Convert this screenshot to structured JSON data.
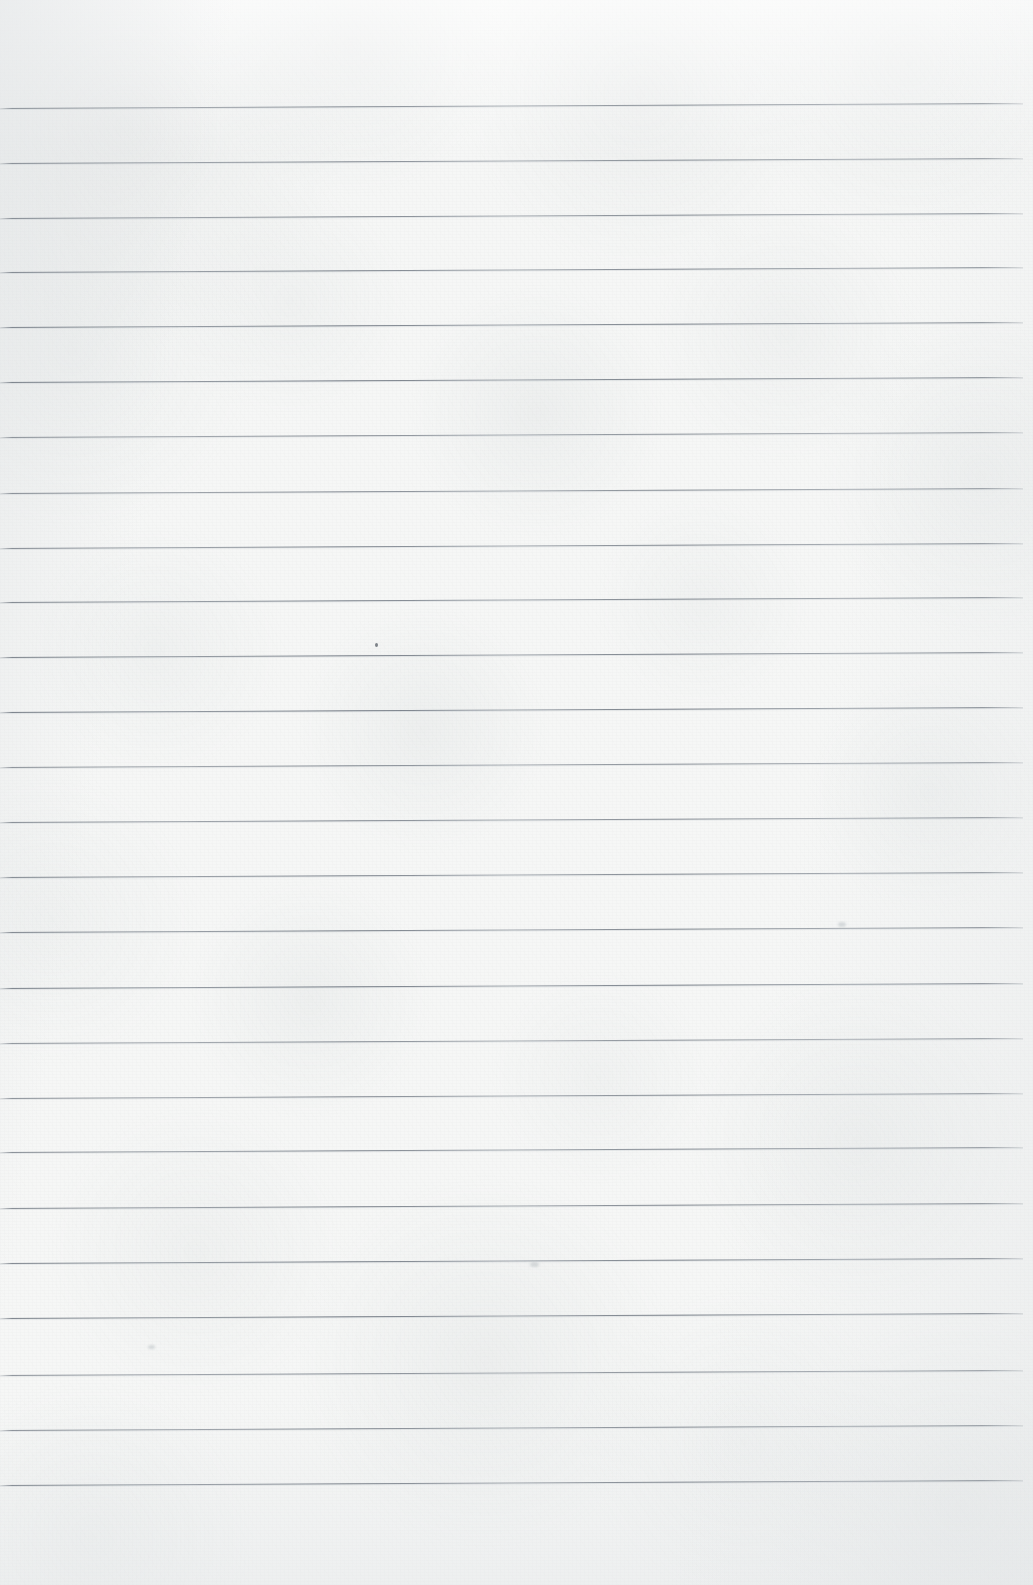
{
  "document": {
    "type": "scanned-paper",
    "kind": "blank ruled notebook page",
    "title": "",
    "visible_text": "",
    "has_handwriting": false,
    "has_printed_text": false,
    "page_width_px": 1033,
    "page_height_px": 1585
  },
  "paper": {
    "background_color": "#f6f7f6",
    "highlight_color": "#ffffff",
    "shadow_color": "#dee1e3",
    "texture": "mottled scan grain",
    "top_margin_px": 108,
    "bottom_margin_px": 100,
    "left_margin_px": 0,
    "right_margin_px": 10,
    "margin_rule": "none"
  },
  "rules": {
    "color": "#6c7480",
    "thickness_px": 1,
    "spacing_px": 55,
    "first_line_y": 108,
    "last_line_y": 1485,
    "count": 26,
    "line_start_x": 0,
    "line_end_x": 1023,
    "skew_rise_px": 5,
    "positions_y": [
      108,
      163,
      218,
      272,
      327,
      382,
      437,
      493,
      548,
      602,
      657,
      712,
      767,
      822,
      877,
      932,
      988,
      1043,
      1098,
      1152,
      1208,
      1263,
      1318,
      1375,
      1430,
      1485
    ]
  },
  "marks": [
    {
      "name": "pen-speck",
      "x": 375,
      "y": 643,
      "w": 3,
      "h": 4
    },
    {
      "name": "paper-smudge",
      "x": 148,
      "y": 1345,
      "w": 7,
      "h": 4
    },
    {
      "name": "paper-smudge",
      "x": 530,
      "y": 1262,
      "w": 9,
      "h": 5
    },
    {
      "name": "paper-smudge",
      "x": 838,
      "y": 922,
      "w": 8,
      "h": 5
    }
  ]
}
